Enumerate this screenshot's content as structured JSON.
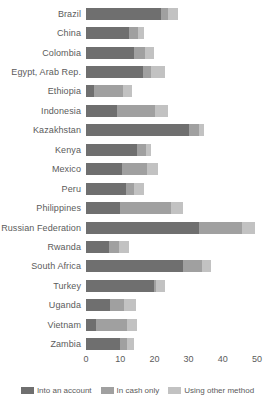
{
  "chart_data": {
    "type": "bar",
    "orientation": "horizontal",
    "stacked": true,
    "title": "",
    "subtitle": "",
    "xlabel": "",
    "ylabel": "",
    "xlim": [
      0,
      50
    ],
    "xticks": [
      0,
      10,
      20,
      30,
      40,
      50
    ],
    "xtick_labels": [
      "0",
      "10",
      "20",
      "30",
      "40",
      "50"
    ],
    "grid": false,
    "legend_position": "bottom",
    "categories": [
      "Brazil",
      "China",
      "Colombia",
      "Egypt, Arab Rep.",
      "Ethiopia",
      "Indonesia",
      "Kazakhstan",
      "Kenya",
      "Mexico",
      "Peru",
      "Philippines",
      "Russian Federation",
      "Rwanda",
      "South Africa",
      "Turkey",
      "Uganda",
      "Vietnam",
      "Zambia"
    ],
    "series": [
      {
        "name": "Into an account",
        "color": "#6f6f6f",
        "values": [
          21.8,
          12.7,
          14.0,
          16.7,
          2.4,
          9.0,
          30.0,
          15.0,
          10.6,
          11.8,
          10.0,
          33.0,
          6.7,
          28.5,
          20.0,
          7.0,
          2.8,
          10.0
        ]
      },
      {
        "name": "In cash only",
        "color": "#a0a0a0",
        "values": [
          2.2,
          2.4,
          3.3,
          2.4,
          8.5,
          11.2,
          3.0,
          2.4,
          7.3,
          2.1,
          15.0,
          12.7,
          3.0,
          5.5,
          0.6,
          4.2,
          9.1,
          2.1
        ]
      },
      {
        "name": "Using other method",
        "color": "#c2c2c2",
        "values": [
          3.0,
          1.8,
          2.7,
          3.9,
          2.6,
          3.8,
          1.5,
          1.6,
          3.1,
          3.1,
          3.5,
          3.8,
          2.8,
          2.5,
          2.4,
          3.4,
          3.1,
          1.9
        ]
      }
    ]
  },
  "legend": {
    "items": [
      {
        "label": "Into an account",
        "color": "#6f6f6f"
      },
      {
        "label": "In cash only",
        "color": "#a0a0a0"
      },
      {
        "label": "Using other method",
        "color": "#c2c2c2"
      }
    ]
  }
}
